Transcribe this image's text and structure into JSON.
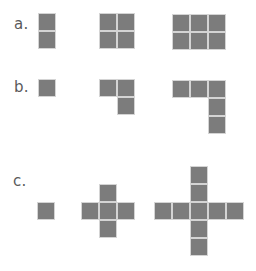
{
  "diagram": {
    "tile_size": 18,
    "tile_color": "#7c7c7c",
    "tile_border_color": "#d4d4d4",
    "label_color": "#5a5a5a",
    "rows": [
      {
        "label": "a.",
        "label_pos": [
          14,
          17
        ],
        "figures": [
          {
            "name": "a-figure-1",
            "origin": [
              38,
              13
            ],
            "cells": [
              [
                0,
                0
              ],
              [
                0,
                1
              ]
            ]
          },
          {
            "name": "a-figure-2",
            "origin": [
              99,
              13
            ],
            "cells": [
              [
                0,
                0
              ],
              [
                1,
                0
              ],
              [
                0,
                1
              ],
              [
                1,
                1
              ]
            ]
          },
          {
            "name": "a-figure-3",
            "origin": [
              172,
              14
            ],
            "cells": [
              [
                0,
                0
              ],
              [
                1,
                0
              ],
              [
                2,
                0
              ],
              [
                0,
                1
              ],
              [
                1,
                1
              ],
              [
                2,
                1
              ]
            ]
          }
        ]
      },
      {
        "label": "b.",
        "label_pos": [
          14,
          80
        ],
        "figures": [
          {
            "name": "b-figure-1",
            "origin": [
              38,
              79
            ],
            "cells": [
              [
                0,
                0
              ]
            ]
          },
          {
            "name": "b-figure-2",
            "origin": [
              99,
              79
            ],
            "cells": [
              [
                0,
                0
              ],
              [
                1,
                0
              ],
              [
                1,
                1
              ]
            ]
          },
          {
            "name": "b-figure-3",
            "origin": [
              172,
              80
            ],
            "cells": [
              [
                0,
                0
              ],
              [
                1,
                0
              ],
              [
                2,
                0
              ],
              [
                2,
                1
              ],
              [
                2,
                2
              ]
            ]
          }
        ]
      },
      {
        "label": "c.",
        "label_pos": [
          13,
          174
        ],
        "figures": [
          {
            "name": "c-figure-1",
            "origin": [
              37,
              202
            ],
            "cells": [
              [
                0,
                0
              ]
            ]
          },
          {
            "name": "c-figure-2",
            "origin": [
              81,
              184
            ],
            "cells": [
              [
                1,
                0
              ],
              [
                0,
                1
              ],
              [
                1,
                1
              ],
              [
                2,
                1
              ],
              [
                1,
                2
              ]
            ]
          },
          {
            "name": "c-figure-3",
            "origin": [
              154,
              166
            ],
            "cells": [
              [
                2,
                0
              ],
              [
                2,
                1
              ],
              [
                0,
                2
              ],
              [
                1,
                2
              ],
              [
                2,
                2
              ],
              [
                3,
                2
              ],
              [
                4,
                2
              ],
              [
                2,
                3
              ],
              [
                2,
                4
              ]
            ]
          }
        ]
      }
    ]
  }
}
